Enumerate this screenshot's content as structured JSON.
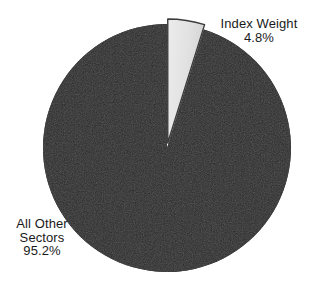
{
  "chart_data": {
    "type": "pie",
    "title": "",
    "subtitle": "",
    "xlabel": "",
    "ylabel": "",
    "legend_position": "none",
    "grid": false,
    "background_color": "#ffffff",
    "center": {
      "x": 167,
      "y": 148
    },
    "radius": 124,
    "start_angle_deg": 0,
    "slices": [
      {
        "name": "Index Weight",
        "label": "Index Weight",
        "value": 4.8,
        "value_label": "4.8%",
        "color": "#e3e3e3",
        "stroke_color": "#3b3b3b",
        "exploded": true,
        "explode_offset": 5,
        "label_position": "top-right"
      },
      {
        "name": "All Other Sectors",
        "label_lines": [
          "All Other",
          "Sectors"
        ],
        "value": 95.2,
        "value_label": "95.2%",
        "color": "#1f1f1f",
        "stroke_color": "#1f1f1f",
        "exploded": false,
        "explode_offset": 0,
        "label_position": "bottom-left"
      }
    ],
    "values": [
      4.8,
      95.2
    ],
    "categories": [
      "Index Weight",
      "All Other Sectors"
    ],
    "units": "%"
  },
  "labels": {
    "index_weight": {
      "name": "Index Weight",
      "percent": "4.8%"
    },
    "all_other_sectors": {
      "line1": "All Other",
      "line2": "Sectors",
      "percent": "95.2%"
    }
  },
  "colors": {
    "major_slice": "#1f1f1f",
    "minor_slice": "#e3e3e3",
    "outline": "#3b3b3b",
    "text": "#1a1a1a",
    "background": "#ffffff"
  }
}
